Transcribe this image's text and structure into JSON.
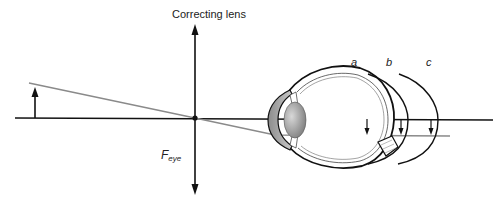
{
  "diagram": {
    "labels": {
      "lens": "Correcting lens",
      "focal_point_main": "F",
      "focal_point_sub": "eye",
      "retina_positions": [
        "a",
        "b",
        "c"
      ]
    },
    "elements": {
      "optical_axis": "horizontal black line",
      "object_arrow": "upright arrow at left",
      "ray": "gray ray from object tip through lens center",
      "lens": "vertical double-headed arrow (converging lens symbol)",
      "eye": "cross-section of human eye with cornea, iris, lens, optic nerve",
      "retina_curves": "three arcs a, b, c marking possible retina positions with image arrows"
    },
    "colors": {
      "line": "#111111",
      "ray": "#8a8a8a",
      "lens_fill": "#9a9a9a",
      "cornea_fill": "#b0b0b0"
    }
  }
}
